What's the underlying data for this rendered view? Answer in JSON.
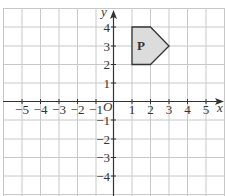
{
  "diagram": {
    "type": "coordinate-grid",
    "axes": {
      "x_label": "x",
      "y_label": "y",
      "origin_label": "O",
      "x_ticks": [
        "−5",
        "−4",
        "−3",
        "−2",
        "−1",
        "1",
        "2",
        "3",
        "4",
        "5"
      ],
      "y_ticks": [
        "4",
        "3",
        "2",
        "1",
        "−1",
        "−2",
        "−3",
        "−4"
      ]
    },
    "shape": {
      "label": "P",
      "vertices": [
        [
          1,
          2
        ],
        [
          1,
          4
        ],
        [
          2,
          4
        ],
        [
          3,
          3
        ],
        [
          2,
          2
        ]
      ],
      "fill": "#dcdcdc",
      "stroke": "#333333"
    },
    "colors": {
      "grid": "#c8c8c8",
      "axis": "#333333"
    }
  }
}
